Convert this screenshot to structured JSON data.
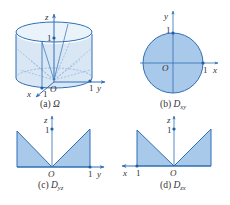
{
  "colors": {
    "axis": "#2f6fb5",
    "fill": "#a9c9ea",
    "edge": "#2f6fb5",
    "dashed": "#7fa8d4",
    "text": "#333333",
    "dot": "#1f5fa8"
  },
  "panels": [
    {
      "id": "a",
      "caption_prefix": "(a)",
      "caption_symbol": "Ω",
      "caption_sub": "",
      "axes": {
        "vertical": "z",
        "horizontal": "y",
        "depth": "x"
      },
      "ticks": {
        "z": "1",
        "y": "1",
        "x": "1"
      },
      "origin": "O",
      "description": "3D solid: cylinder x^2+y^2<=1 bounded above by a cone-like surface"
    },
    {
      "id": "b",
      "caption_prefix": "(b)",
      "caption_symbol": "D",
      "caption_sub": "xy",
      "axes": {
        "vertical": "y",
        "horizontal": "x"
      },
      "ticks": {
        "y": "1",
        "x": "1"
      },
      "origin": "O",
      "description": "Unit disk projection onto xy-plane"
    },
    {
      "id": "c",
      "caption_prefix": "(c)",
      "caption_symbol": "D",
      "caption_sub": "yz",
      "axes": {
        "vertical": "z",
        "horizontal": "y"
      },
      "ticks": {
        "z": "1",
        "y": "1"
      },
      "origin": "O",
      "description": "Projection onto yz-plane: two triangles meeting at origin"
    },
    {
      "id": "d",
      "caption_prefix": "(d)",
      "caption_symbol": "D",
      "caption_sub": "zx",
      "axes": {
        "vertical": "z",
        "horizontal": "x"
      },
      "ticks": {
        "z": "1",
        "x": "1"
      },
      "origin": "O",
      "description": "Projection onto zx-plane: two triangles meeting at origin, x axis pointing left"
    }
  ]
}
